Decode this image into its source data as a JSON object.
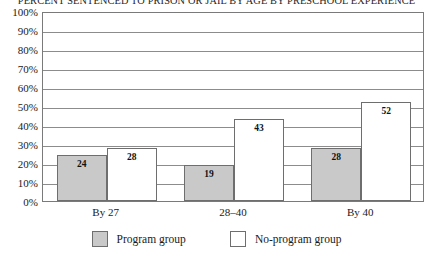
{
  "chart_data": {
    "type": "bar",
    "title": "PERCENT SENTENCED TO PRISON OR JAIL BY AGE BY PRESCHOOL EXPERIENCE",
    "xlabel": "",
    "ylabel": "",
    "categories": [
      "By 27",
      "28–40",
      "By 40"
    ],
    "series": [
      {
        "name": "Program group",
        "values": [
          24,
          19,
          28
        ],
        "color": "#c9c9c9"
      },
      {
        "name": "No-program group",
        "values": [
          28,
          43,
          52
        ],
        "color": "#ffffff"
      }
    ],
    "ylim": [
      0,
      100
    ],
    "ytick_labels": [
      "0%",
      "10%",
      "20%",
      "30%",
      "40%",
      "50%",
      "60%",
      "70%",
      "80%",
      "90%",
      "100%"
    ],
    "ytick_values": [
      0,
      10,
      20,
      30,
      40,
      50,
      60,
      70,
      80,
      90,
      100
    ],
    "grid": true,
    "legend_position": "bottom",
    "bar_labels": [
      "24",
      "28",
      "19",
      "43",
      "28",
      "52"
    ]
  },
  "legend": {
    "items": [
      {
        "label": "Program group",
        "swatch": "program"
      },
      {
        "label": "No-program group",
        "swatch": "noprogram"
      }
    ]
  }
}
